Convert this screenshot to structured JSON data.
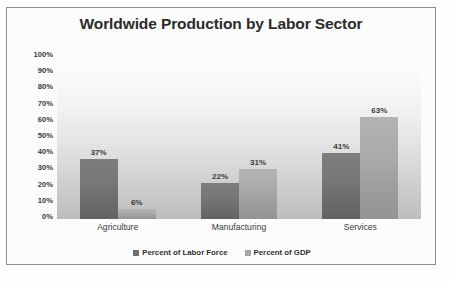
{
  "chart_data": {
    "type": "bar",
    "title": "Worldwide Production by Labor Sector",
    "xlabel": "",
    "ylabel": "",
    "categories": [
      "Agriculture",
      "Manufacturing",
      "Services"
    ],
    "series": [
      {
        "name": "Percent of Labor Force",
        "color": "#6f6f6f",
        "values": [
          37,
          22,
          41
        ],
        "labels": [
          "37%",
          "22%",
          "41%"
        ]
      },
      {
        "name": "Percent of GDP",
        "color": "#a5a5a5",
        "values": [
          6,
          31,
          63
        ],
        "labels": [
          "6%",
          "31%",
          "63%"
        ]
      }
    ],
    "ylim": [
      0,
      100
    ],
    "y_ticks": [
      100,
      90,
      80,
      70,
      60,
      50,
      40,
      30,
      20,
      10,
      0
    ],
    "y_tick_labels": [
      "100%",
      "90%",
      "80%",
      "70%",
      "60%",
      "50%",
      "40%",
      "30%",
      "20%",
      "10%",
      "0%"
    ],
    "grid": false,
    "legend_position": "bottom",
    "plot_background": "gradient-white-to-gray",
    "border_color": "#8d8d8d"
  }
}
